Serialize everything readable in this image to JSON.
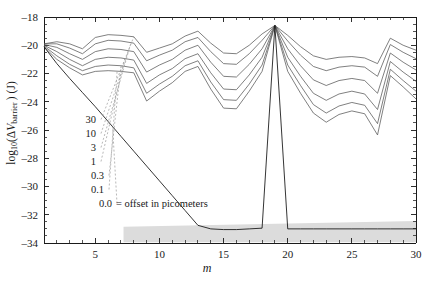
{
  "chart_data": {
    "type": "line",
    "title": "",
    "xlabel": "m",
    "ylabel": "log10(ΔV_barrier) (J)",
    "xlim": [
      1,
      30
    ],
    "ylim": [
      -34,
      -18
    ],
    "xticks_major": [
      5,
      10,
      15,
      20,
      25,
      30
    ],
    "xtick_labels": [
      "5",
      "10",
      "15",
      "20",
      "25",
      "30"
    ],
    "xticks_minor_step": 1,
    "yticks_major": [
      -18,
      -20,
      -22,
      -24,
      -26,
      -28,
      -30,
      -32,
      -34
    ],
    "ytick_labels": [
      "–18",
      "–20",
      "–22",
      "–24",
      "–26",
      "–28",
      "–30",
      "–32",
      "–34"
    ],
    "yticks_minor_step": 0.5,
    "grid": false,
    "legend_position": "inside-lower-left",
    "legend_note": "0.0 = offset in picometers",
    "legend_entries": [
      {
        "label": "30",
        "offset_pm": 30
      },
      {
        "label": "10",
        "offset_pm": 10
      },
      {
        "label": "3",
        "offset_pm": 3
      },
      {
        "label": "1",
        "offset_pm": 1
      },
      {
        "label": "0.3",
        "offset_pm": 0.3
      },
      {
        "label": "0.1",
        "offset_pm": 0.1
      },
      {
        "label": "0.0",
        "offset_pm": 0.0
      }
    ],
    "x": [
      1,
      2,
      3,
      4,
      5,
      6,
      7,
      8,
      9,
      10,
      11,
      12,
      13,
      14,
      15,
      16,
      17,
      18,
      19,
      20,
      21,
      22,
      23,
      24,
      25,
      26,
      27,
      28,
      29,
      30
    ],
    "series": [
      {
        "name": "30",
        "offset_pm": 30,
        "values": [
          -19.9,
          -19.75,
          -19.9,
          -20.25,
          -19.45,
          -19.25,
          -19.3,
          -19.4,
          -20.5,
          -20.2,
          -19.9,
          -19.35,
          -19.0,
          -19.85,
          -20.55,
          -20.6,
          -20.0,
          -19.2,
          -18.6,
          -19.3,
          -20.1,
          -20.75,
          -21.0,
          -20.85,
          -20.8,
          -20.9,
          -21.3,
          -19.5,
          -20.0,
          -20.35
        ]
      },
      {
        "name": "10",
        "offset_pm": 10,
        "values": [
          -19.9,
          -19.9,
          -20.2,
          -20.6,
          -19.9,
          -19.65,
          -19.7,
          -19.85,
          -21.1,
          -20.7,
          -20.35,
          -19.75,
          -19.45,
          -20.45,
          -21.3,
          -21.35,
          -20.6,
          -19.65,
          -18.6,
          -19.7,
          -20.7,
          -21.5,
          -21.8,
          -21.55,
          -21.45,
          -21.55,
          -22.2,
          -19.95,
          -20.5,
          -20.95
        ]
      },
      {
        "name": "3",
        "offset_pm": 3,
        "values": [
          -19.95,
          -20.15,
          -20.6,
          -21.0,
          -20.45,
          -20.25,
          -20.3,
          -20.45,
          -21.9,
          -21.4,
          -21.0,
          -20.35,
          -20.0,
          -21.2,
          -22.2,
          -22.25,
          -21.35,
          -20.25,
          -18.6,
          -20.25,
          -21.45,
          -22.45,
          -22.85,
          -22.5,
          -22.35,
          -22.5,
          -23.4,
          -20.55,
          -21.2,
          -21.75
        ]
      },
      {
        "name": "1",
        "offset_pm": 1,
        "values": [
          -20.0,
          -20.45,
          -21.0,
          -21.45,
          -21.0,
          -20.85,
          -20.9,
          -21.05,
          -22.7,
          -22.1,
          -21.65,
          -20.95,
          -20.6,
          -21.95,
          -23.1,
          -23.15,
          -22.1,
          -20.85,
          -18.6,
          -20.85,
          -22.2,
          -23.4,
          -23.9,
          -23.45,
          -23.25,
          -23.45,
          -24.55,
          -21.15,
          -21.9,
          -22.55
        ]
      },
      {
        "name": "0.3",
        "offset_pm": 0.3,
        "values": [
          -20.05,
          -20.75,
          -21.35,
          -21.8,
          -21.5,
          -21.4,
          -21.45,
          -21.6,
          -23.4,
          -22.75,
          -22.2,
          -21.45,
          -21.1,
          -22.6,
          -23.85,
          -23.9,
          -22.75,
          -21.4,
          -18.6,
          -21.4,
          -22.85,
          -24.2,
          -24.8,
          -24.3,
          -24.05,
          -24.25,
          -25.55,
          -21.7,
          -22.5,
          -23.25
        ]
      },
      {
        "name": "0.1",
        "offset_pm": 0.1,
        "values": [
          -20.1,
          -21.0,
          -21.6,
          -22.1,
          -21.85,
          -21.8,
          -21.85,
          -21.95,
          -23.95,
          -23.25,
          -22.65,
          -21.85,
          -21.5,
          -23.1,
          -24.45,
          -24.5,
          -23.25,
          -21.85,
          -18.6,
          -21.85,
          -23.4,
          -24.8,
          -25.45,
          -24.9,
          -24.65,
          -24.85,
          -26.35,
          -22.15,
          -22.95,
          -23.8
        ]
      },
      {
        "name": "0.0",
        "offset_pm": 0.0,
        "values": [
          -20.1,
          -21.3,
          -22.35,
          -23.35,
          -24.35,
          -25.4,
          -26.45,
          -27.5,
          -28.55,
          -29.6,
          -30.65,
          -31.7,
          -32.75,
          -33.0,
          -33.05,
          -33.05,
          -33.0,
          -32.95,
          -18.6,
          -33.0,
          -33.0,
          -33.0,
          -33.0,
          -33.0,
          -33.0,
          -33.0,
          -33.0,
          -33.0,
          -33.0,
          -33.0
        ]
      }
    ],
    "annotations": {
      "noise_band": {
        "description": "gray shaded numerical-noise band",
        "x_start": 7.2,
        "x_end": 30,
        "y_top_at_start": -32.85,
        "y_top_at_end": -32.45,
        "y_bottom": -33.95,
        "color": "#dcdcdc"
      },
      "convergence_peak": {
        "m": 19,
        "value": -18.6
      },
      "origin_point": {
        "m": 1,
        "value": -19.9
      }
    }
  }
}
